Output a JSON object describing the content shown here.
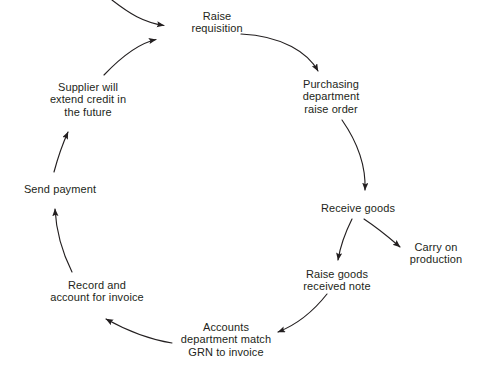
{
  "diagram": {
    "type": "cycle-flow",
    "background_color": "#ffffff",
    "text_color": "#231f20",
    "line_color": "#231f20",
    "nodes": [
      {
        "id": "raise-requisition",
        "lines": [
          "Raise",
          "requisition"
        ],
        "x": 217,
        "y": 22
      },
      {
        "id": "purchasing-department-raise-order",
        "lines": [
          "Purchasing",
          "department",
          "raise order"
        ],
        "x": 331,
        "y": 97
      },
      {
        "id": "receive-goods",
        "lines": [
          "Receive goods"
        ],
        "x": 358,
        "y": 208
      },
      {
        "id": "carry-on-production",
        "lines": [
          "Carry on",
          "production"
        ],
        "x": 436,
        "y": 253
      },
      {
        "id": "raise-goods-received-note",
        "lines": [
          "Raise goods",
          "received note"
        ],
        "x": 337,
        "y": 280
      },
      {
        "id": "accounts-department-match-grn-to-invoice",
        "lines": [
          "Accounts",
          "department match",
          "GRN to invoice"
        ],
        "x": 226,
        "y": 340
      },
      {
        "id": "record-and-account-for-invoice",
        "lines": [
          "Record and",
          "account for invoice"
        ],
        "x": 97,
        "y": 291
      },
      {
        "id": "send-payment",
        "lines": [
          "Send payment"
        ],
        "x": 60,
        "y": 189
      },
      {
        "id": "supplier-will-extend-credit-in-the-future",
        "lines": [
          "Supplier will",
          "extend credit in",
          "the future"
        ],
        "x": 88,
        "y": 100
      }
    ],
    "edges": [
      {
        "id": "entry-to-raise-requisition",
        "from": "external-input",
        "to": "raise-requisition"
      },
      {
        "id": "raise-requisition-to-purchasing",
        "from": "raise-requisition",
        "to": "purchasing-department-raise-order"
      },
      {
        "id": "purchasing-to-receive-goods",
        "from": "purchasing-department-raise-order",
        "to": "receive-goods"
      },
      {
        "id": "receive-goods-to-carry-on-production",
        "from": "receive-goods",
        "to": "carry-on-production"
      },
      {
        "id": "receive-goods-to-raise-grn",
        "from": "receive-goods",
        "to": "raise-goods-received-note"
      },
      {
        "id": "raise-grn-to-accounts",
        "from": "raise-goods-received-note",
        "to": "accounts-department-match-grn-to-invoice"
      },
      {
        "id": "accounts-to-record-invoice",
        "from": "accounts-department-match-grn-to-invoice",
        "to": "record-and-account-for-invoice"
      },
      {
        "id": "record-invoice-to-send-payment",
        "from": "record-and-account-for-invoice",
        "to": "send-payment"
      },
      {
        "id": "send-payment-to-supplier-credit",
        "from": "send-payment",
        "to": "supplier-will-extend-credit-in-the-future"
      },
      {
        "id": "supplier-credit-to-raise-requisition",
        "from": "supplier-will-extend-credit-in-the-future",
        "to": "raise-requisition"
      }
    ]
  }
}
